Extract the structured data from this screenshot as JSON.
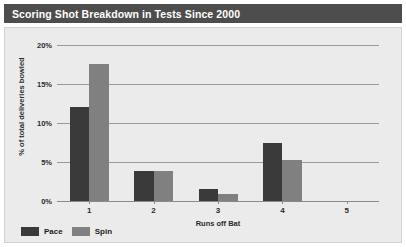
{
  "title": "Scoring Shot Breakdown in Tests Since 2000",
  "colors": {
    "title_bar": "#4d4d4d",
    "title_text": "#ffffff",
    "panel_background": "#ebebeb",
    "gridline": "#9a9a9a",
    "pace": "#3a3a3a",
    "spin": "#808080"
  },
  "legend": {
    "position": "bottom-left",
    "items": [
      {
        "label": "Pace",
        "color": "#3a3a3a",
        "swatch": "legend-swatch-pace"
      },
      {
        "label": "Spin",
        "color": "#808080",
        "swatch": "legend-swatch-spin"
      }
    ]
  },
  "axes": {
    "y": {
      "label": "% of total deliveries bowled",
      "ticks": [
        "0%",
        "5%",
        "10%",
        "15%",
        "20%"
      ],
      "tick_values": [
        0,
        5,
        10,
        15,
        20
      ],
      "min": 0,
      "max": 20
    },
    "x": {
      "label": "Runs off Bat",
      "ticks": [
        "1",
        "2",
        "3",
        "4",
        "5"
      ]
    }
  },
  "chart_data": {
    "type": "bar",
    "title": "Scoring Shot Breakdown in Tests Since 2000",
    "xlabel": "Runs off Bat",
    "ylabel": "% of total deliveries bowled",
    "categories": [
      "1",
      "2",
      "3",
      "4",
      "5"
    ],
    "ylim": [
      0,
      20
    ],
    "grid": true,
    "legend_position": "bottom-left",
    "series": [
      {
        "name": "Pace",
        "color": "#3a3a3a",
        "values": [
          12.0,
          3.8,
          1.5,
          7.5,
          0.0
        ]
      },
      {
        "name": "Spin",
        "color": "#808080",
        "values": [
          17.6,
          3.8,
          0.9,
          5.2,
          0.0
        ]
      }
    ]
  }
}
